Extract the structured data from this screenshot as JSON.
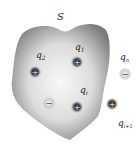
{
  "diagram": {
    "surface": {
      "label": "S",
      "fill_edge": "#8a8a8a",
      "fill_center": "#f4f4f4"
    },
    "charges": [
      {
        "id": "q2",
        "label": "q",
        "sub": "2",
        "sign": "+",
        "inside": true
      },
      {
        "id": "q1",
        "label": "q",
        "sub": "1",
        "sign": "+",
        "inside": true
      },
      {
        "id": "qn",
        "label": "q",
        "sub": "n",
        "sign": "−",
        "inside": false
      },
      {
        "id": "qi",
        "label": "q",
        "sub": "i",
        "sign": "+",
        "inside": true
      },
      {
        "id": "neg",
        "label": "",
        "sub": "",
        "sign": "−",
        "inside": true
      },
      {
        "id": "qi1",
        "label": "q",
        "sub": "i+1",
        "sign": "+",
        "inside": false
      }
    ],
    "colors": {
      "positive": "#3a3a3a",
      "negative": "#d8d8d8"
    }
  }
}
